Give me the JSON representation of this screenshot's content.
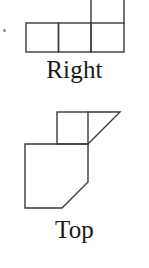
{
  "page": {
    "width": 149,
    "height": 268,
    "background_color": "#ffffff",
    "line_color": "#3a3a3a",
    "text_color": "#1a1a1a"
  },
  "views": [
    {
      "id": "right",
      "label": "Right",
      "shape_type": "orthographic-view-outline",
      "description": "Row of three squares with a fourth square stacked on top of the rightmost square; top square is clipped by the top edge of the image",
      "stroke_color": "#3a3a3a",
      "stroke_width": 1.4,
      "grid_unit_px": 33,
      "cells": [
        {
          "col": 0,
          "row": 1
        },
        {
          "col": 1,
          "row": 1
        },
        {
          "col": 2,
          "row": 1
        },
        {
          "col": 2,
          "row": 0
        }
      ]
    },
    {
      "id": "top",
      "label": "Top",
      "shape_type": "orthographic-view-outline",
      "description": "Upper square with a right triangle attached on its right side, above a larger rectangle whose lower-right corner is chamfered by a 45 degree diagonal",
      "stroke_color": "#3a3a3a",
      "stroke_width": 1.4,
      "upper_square": {
        "x": 57,
        "y": 112,
        "size": 31
      },
      "upper_triangle": {
        "points": "88,112 120,112 88,143"
      },
      "lower_body": {
        "points": "25,144 88,144 88,182 62,208 25,208"
      }
    }
  ],
  "labels": {
    "right": "Right",
    "top": "Top"
  }
}
